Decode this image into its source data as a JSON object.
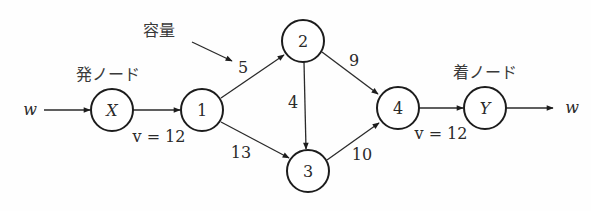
{
  "diagram": {
    "type": "flow-network",
    "annotations": {
      "capacity_label": "容量",
      "source_label": "発ノード",
      "sink_label": "着ノード",
      "input_flow": "w",
      "output_flow": "w",
      "source_out_flow": "v = 12",
      "sink_in_flow": "v = 12"
    },
    "nodes": [
      {
        "id": "X",
        "label": "X",
        "role": "source"
      },
      {
        "id": "1",
        "label": "1"
      },
      {
        "id": "2",
        "label": "2"
      },
      {
        "id": "3",
        "label": "3"
      },
      {
        "id": "4",
        "label": "4"
      },
      {
        "id": "Y",
        "label": "Y",
        "role": "sink"
      }
    ],
    "edges": [
      {
        "from": "w",
        "to": "X",
        "label": ""
      },
      {
        "from": "X",
        "to": "1",
        "label": ""
      },
      {
        "from": "1",
        "to": "2",
        "label": "5"
      },
      {
        "from": "1",
        "to": "3",
        "label": "13"
      },
      {
        "from": "2",
        "to": "3",
        "label": "4"
      },
      {
        "from": "2",
        "to": "4",
        "label": "9"
      },
      {
        "from": "3",
        "to": "4",
        "label": "10"
      },
      {
        "from": "4",
        "to": "Y",
        "label": ""
      },
      {
        "from": "Y",
        "to": "w",
        "label": ""
      }
    ]
  }
}
